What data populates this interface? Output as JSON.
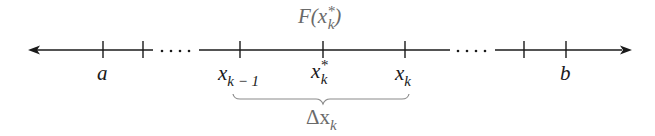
{
  "diagram": {
    "type": "number-line-partition",
    "top_label": {
      "base": "F(x",
      "sub": "k",
      "sup": "*",
      "close": ")"
    },
    "ticks": [
      {
        "id": "a",
        "x": 103,
        "label": "a"
      },
      {
        "id": "t2",
        "x": 143,
        "label": ""
      },
      {
        "id": "xk_minus_1",
        "x": 240,
        "label": "x",
        "sub": "k − 1"
      },
      {
        "id": "xk_star",
        "x": 323,
        "label": "x",
        "sub": "k",
        "sup": "*"
      },
      {
        "id": "xk",
        "x": 405,
        "label": "x",
        "sub": "k"
      },
      {
        "id": "t6",
        "x": 524,
        "label": ""
      },
      {
        "id": "b",
        "x": 566,
        "label": "b"
      }
    ],
    "ellipses": [
      "....",
      "...."
    ],
    "brace_label": {
      "base": "Δx",
      "sub": "k"
    },
    "colors": {
      "line": "#1a1a1a",
      "secondary_text": "#6a6a6a",
      "brace": "#8a8a8a"
    }
  }
}
